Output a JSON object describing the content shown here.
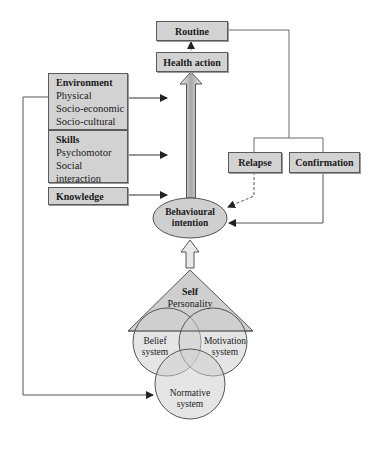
{
  "diagram": {
    "top_boxes": {
      "routine": "Routine",
      "health_action": "Health action"
    },
    "factor_boxes": [
      {
        "title": "Environment",
        "items": [
          "Physical",
          "Socio-economic",
          "Socio-cultural"
        ]
      },
      {
        "title": "Skills",
        "items": [
          "Psychomotor",
          "Social interaction",
          "Self-regulatory"
        ]
      },
      {
        "title": "Knowledge",
        "items": []
      }
    ],
    "feedback_boxes": {
      "relapse": "Relapse",
      "confirmation": "Confirmation"
    },
    "intention": {
      "line1": "Behavioural",
      "line2": "intention"
    },
    "self": {
      "title": "Self",
      "subtitle": "Personality"
    },
    "circles": {
      "belief": {
        "line1": "Belief",
        "line2": "system"
      },
      "motivation": {
        "line1": "Motivation",
        "line2": "system"
      },
      "normative": {
        "line1": "Normative",
        "line2": "system"
      }
    },
    "colors": {
      "box_fill": "#d2d2d2",
      "line": "#4a4a4a",
      "shape_fill": "#cfcfcf"
    }
  }
}
